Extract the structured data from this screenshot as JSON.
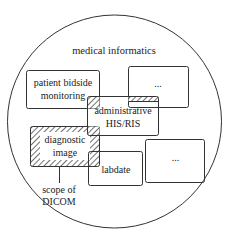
{
  "title": "medical informatics",
  "boxes": {
    "patient": {
      "line1": "patient bidside",
      "line2": "monitoring"
    },
    "top_right": {
      "label": "..."
    },
    "admin": {
      "line1": "administrative",
      "line2": "HIS/RIS"
    },
    "diagnostic": {
      "line1": "diagnostic",
      "line2": "image"
    },
    "labdate": {
      "label": "labdate"
    },
    "bottom_right": {
      "label": "..."
    }
  },
  "annotation": {
    "line1": "scope of",
    "line2": "DICOM"
  },
  "colors": {
    "stroke": "#333333",
    "text": "#222222",
    "background": "#ffffff"
  }
}
